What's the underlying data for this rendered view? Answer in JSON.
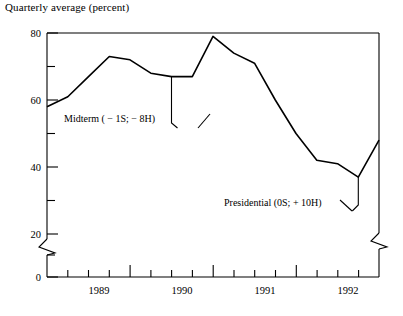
{
  "chart_data": {
    "type": "line",
    "title": "Quarterly average (percent)",
    "xlabel": "",
    "ylabel": "",
    "ylim": [
      0,
      80
    ],
    "yticks": [
      0,
      20,
      40,
      60,
      80
    ],
    "yticks_minor": [
      10,
      30,
      50,
      70
    ],
    "ytick_labels": [
      "0",
      "20",
      "40",
      "60",
      "80"
    ],
    "y_axis_break": true,
    "right_axis_break": true,
    "grid": false,
    "legend": "none",
    "categories": [
      "1988Q4",
      "1989Q1",
      "1989Q2",
      "1989Q3",
      "1989Q4",
      "1990Q1",
      "1990Q2",
      "1990Q3",
      "1990Q4",
      "1991Q1",
      "1991Q2",
      "1991Q3",
      "1991Q4",
      "1992Q1",
      "1992Q2",
      "1992Q3",
      "1992Q4"
    ],
    "values": [
      58,
      61,
      67,
      73,
      72,
      68,
      67,
      67,
      79,
      74,
      71,
      60,
      50,
      42,
      41,
      37,
      48
    ],
    "xticks_major": [
      "1989",
      "1990",
      "1991",
      "1992"
    ],
    "xtick_labels": [
      "1989",
      "1990",
      "1991",
      "1992"
    ],
    "series": [
      {
        "name": "Quarterly average",
        "values": [
          58,
          61,
          67,
          73,
          72,
          68,
          67,
          67,
          79,
          74,
          71,
          60,
          50,
          42,
          41,
          37,
          48
        ]
      }
    ],
    "annotations": [
      {
        "text": "Midterm ( − 1S;  − 8H)",
        "target_x": "1990Q2",
        "target_y": 67
      },
      {
        "text": "Presidential (0S;  + 10H)",
        "target_x": "1992Q3",
        "target_y": 37
      }
    ]
  },
  "axis": {
    "ylabels": [
      "80",
      "60",
      "40",
      "20",
      "0"
    ],
    "xlabels": [
      "1989",
      "1990",
      "1991",
      "1992"
    ]
  },
  "annotations": {
    "midterm": "Midterm ( − 1S;  − 8H)",
    "presidential": "Presidential (0S;  + 10H)"
  }
}
